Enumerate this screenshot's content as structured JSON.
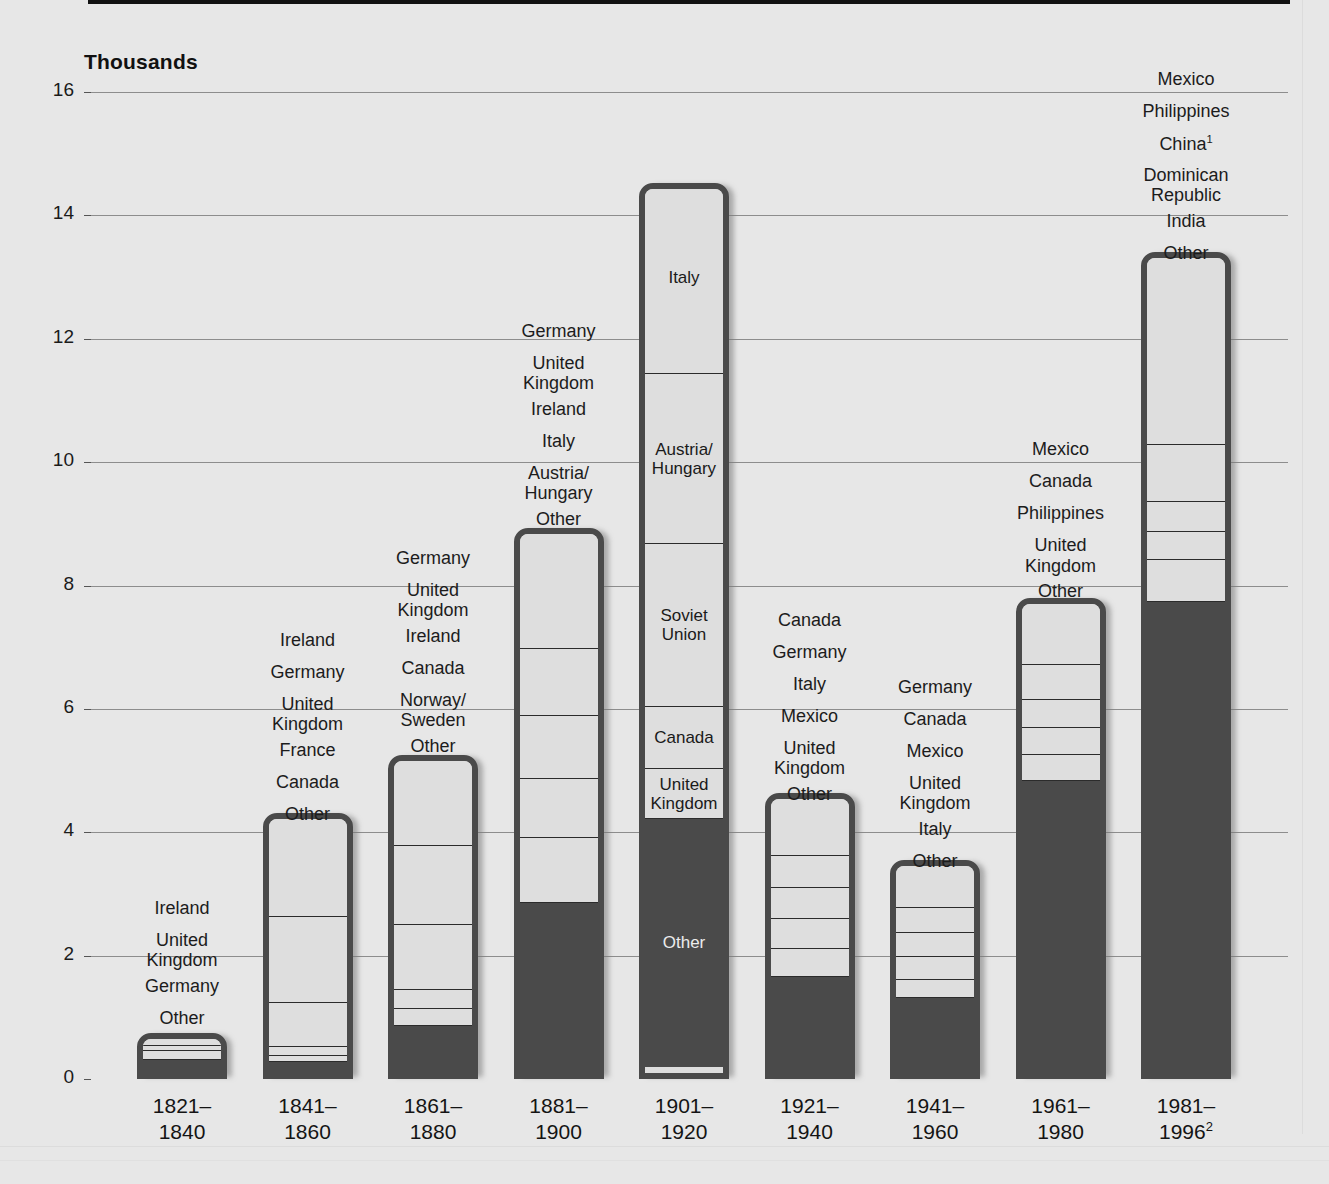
{
  "axis": {
    "unit_title": "Thousands",
    "yticks": [
      0,
      2,
      4,
      6,
      8,
      10,
      12,
      14,
      16
    ],
    "ymin": 0,
    "ymax": 16
  },
  "chart_data": {
    "type": "bar",
    "subtype": "stacked-bar",
    "title": "",
    "subtitle": "",
    "xlabel": "",
    "ylabel": "Thousands",
    "ylim": [
      0,
      16
    ],
    "grid": true,
    "legend": "none (segments labelled above each bar)",
    "categories": [
      "1821–\n1840",
      "1841–\n1860",
      "1861–\n1880",
      "1881–\n1900",
      "1901–\n1920",
      "1921–\n1940",
      "1941–\n1960",
      "1961–\n1980",
      "1981–\n1996"
    ],
    "category_footnotes": [
      "",
      "",
      "",
      "",
      "",
      "",
      "",
      "",
      "2"
    ],
    "totals": [
      0.75,
      4.31,
      5.25,
      8.93,
      14.53,
      4.64,
      3.55,
      7.79,
      13.41
    ],
    "bars": [
      {
        "period": "1821–1840",
        "total": 0.75,
        "segments": [
          {
            "label": "Ireland",
            "value": 0.21,
            "shade": "light"
          },
          {
            "label": "United\nKingdom",
            "value": 0.08,
            "shade": "light"
          },
          {
            "label": "Germany",
            "value": 0.15,
            "shade": "light"
          },
          {
            "label": "Other",
            "value": 0.31,
            "shade": "dark"
          }
        ]
      },
      {
        "period": "1841–1860",
        "total": 4.31,
        "segments": [
          {
            "label": "Ireland",
            "value": 1.69,
            "shade": "light"
          },
          {
            "label": "Germany",
            "value": 1.38,
            "shade": "light"
          },
          {
            "label": "United\nKingdom",
            "value": 0.72,
            "shade": "light"
          },
          {
            "label": "France",
            "value": 0.14,
            "shade": "light"
          },
          {
            "label": "Canada",
            "value": 0.1,
            "shade": "light"
          },
          {
            "label": "Other",
            "value": 0.28,
            "shade": "dark"
          }
        ]
      },
      {
        "period": "1861–1880",
        "total": 5.25,
        "segments": [
          {
            "label": "Germany",
            "value": 1.47,
            "shade": "light"
          },
          {
            "label": "United\nKingdom",
            "value": 1.28,
            "shade": "light"
          },
          {
            "label": "Ireland",
            "value": 1.05,
            "shade": "light"
          },
          {
            "label": "Canada",
            "value": 0.32,
            "shade": "light"
          },
          {
            "label": "Norway/\nSweden",
            "value": 0.27,
            "shade": "light"
          },
          {
            "label": "Other",
            "value": 1.06,
            "shade": "dark"
          }
        ]
      },
      {
        "period": "1881–1900",
        "total": 8.93,
        "segments": [
          {
            "label": "Germany",
            "value": 1.96,
            "shade": "light"
          },
          {
            "label": "United\nKingdom",
            "value": 1.09,
            "shade": "light"
          },
          {
            "label": "Ireland",
            "value": 1.02,
            "shade": "light"
          },
          {
            "label": "Italy",
            "value": 0.96,
            "shade": "light"
          },
          {
            "label": "Austria/\nHungary",
            "value": 1.04,
            "shade": "light"
          },
          {
            "label": "Other",
            "value": 2.86,
            "shade": "dark"
          }
        ]
      },
      {
        "period": "1901–1920",
        "total": 14.53,
        "segments": [
          {
            "label": "Italy",
            "value": 3.1,
            "shade": "light"
          },
          {
            "label": "Austria/\nHungary",
            "value": 2.75,
            "shade": "light"
          },
          {
            "label": "Soviet\nUnion",
            "value": 2.65,
            "shade": "light"
          },
          {
            "label": "Canada",
            "value": 1.0,
            "shade": "light"
          },
          {
            "label": "United\nKingdom",
            "value": 0.81,
            "shade": "light"
          },
          {
            "label": "Other",
            "value": 4.02,
            "shade": "dark"
          }
        ]
      },
      {
        "period": "1921–1940",
        "total": 4.64,
        "segments": [
          {
            "label": "Canada",
            "value": 1.03,
            "shade": "light"
          },
          {
            "label": "Germany",
            "value": 0.51,
            "shade": "light"
          },
          {
            "label": "Italy",
            "value": 0.51,
            "shade": "light"
          },
          {
            "label": "Mexico",
            "value": 0.48,
            "shade": "light"
          },
          {
            "label": "United\nKingdom",
            "value": 0.45,
            "shade": "light"
          },
          {
            "label": "Other",
            "value": 1.66,
            "shade": "dark"
          }
        ]
      },
      {
        "period": "1941–1960",
        "total": 3.55,
        "segments": [
          {
            "label": "Germany",
            "value": 0.78,
            "shade": "light"
          },
          {
            "label": "Canada",
            "value": 0.41,
            "shade": "light"
          },
          {
            "label": "Mexico",
            "value": 0.39,
            "shade": "light"
          },
          {
            "label": "United\nKingdom",
            "value": 0.36,
            "shade": "light"
          },
          {
            "label": "Italy",
            "value": 0.29,
            "shade": "light"
          },
          {
            "label": "Other",
            "value": 1.32,
            "shade": "dark"
          }
        ]
      },
      {
        "period": "1961–1980",
        "total": 7.79,
        "segments": [
          {
            "label": "Mexico",
            "value": 1.08,
            "shade": "light"
          },
          {
            "label": "Canada",
            "value": 0.57,
            "shade": "light"
          },
          {
            "label": "Philippines",
            "value": 0.45,
            "shade": "light"
          },
          {
            "label": "United\nKingdom",
            "value": 0.43,
            "shade": "light"
          },
          {
            "label": "Other",
            "value": 0.43,
            "shade": "light"
          },
          {
            "label": "",
            "value": 4.83,
            "shade": "dark"
          }
        ]
      },
      {
        "period": "1981–1996",
        "total": 13.41,
        "segments": [
          {
            "label": "Mexico",
            "value": 3.14,
            "shade": "light"
          },
          {
            "label": "Philippines",
            "value": 0.91,
            "shade": "light"
          },
          {
            "label": "China",
            "value": 0.5,
            "shade": "light"
          },
          {
            "label": "Dominican\nRepublic",
            "value": 0.45,
            "shade": "light"
          },
          {
            "label": "India",
            "value": 0.67,
            "shade": "light"
          },
          {
            "label": "Other",
            "value": 7.74,
            "shade": "dark"
          }
        ]
      }
    ]
  },
  "annotations": {
    "bar1_labels": [
      "Ireland",
      "United\nKingdom",
      "Germany",
      "Other"
    ],
    "bar2_labels": [
      "Ireland",
      "Germany",
      "United\nKingdom",
      "France",
      "Canada",
      "Other"
    ],
    "bar3_labels": [
      "Germany",
      "United\nKingdom",
      "Ireland",
      "Canada",
      "Norway/\nSweden",
      "Other"
    ],
    "bar4_labels": [
      "Germany",
      "United\nKingdom",
      "Ireland",
      "Italy",
      "Austria/\nHungary",
      "Other"
    ],
    "bar5_inbar": [
      "Italy",
      "Austria/\nHungary",
      "Soviet\nUnion",
      "Canada",
      "United\nKingdom",
      "Other"
    ],
    "bar6_labels": [
      "Canada",
      "Germany",
      "Italy",
      "Mexico",
      "United\nKingdom",
      "Other"
    ],
    "bar7_labels": [
      "Germany",
      "Canada",
      "Mexico",
      "United\nKingdom",
      "Italy",
      "Other"
    ],
    "bar8_labels": [
      "Mexico",
      "Canada",
      "Philippines",
      "United\nKingdom",
      "Other"
    ],
    "bar9_labels": [
      "Mexico",
      "Philippines",
      "China",
      "Dominican\nRepublic",
      "India",
      "Other"
    ],
    "china_footnote": "1",
    "year1996_footnote": "2"
  },
  "colors": {
    "background": "#e7e7e7",
    "bar_outline": "#4a4a4a",
    "segment_light": "#dedede",
    "segment_dark": "#4a4a4a",
    "gridline": "#8d8d8d",
    "text": "#1a1a1a"
  }
}
